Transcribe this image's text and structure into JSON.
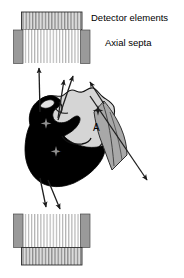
{
  "figure": {
    "type": "diagram",
    "background_color": "#ffffff"
  },
  "annotations": {
    "detector_elements_label": "Detector elements",
    "axial_septa_label": "Axial septa"
  },
  "markers": {
    "a": "A",
    "b": "B",
    "c": "C"
  },
  "colors": {
    "outline": "#000000",
    "septa_block": "#9a9a9a",
    "detector_fill": "#d8d8d8",
    "detector_stripe": "#7a7a7a",
    "organ_dark": "#000000",
    "organ_light": "#d5d5d5",
    "organ_mid": "#a8a8a8",
    "ray": "#262626"
  },
  "detectors": {
    "top": {
      "bar_stripe_count": 26,
      "septa_stripe_count": 22
    },
    "bottom": {
      "bar_stripe_count": 26,
      "septa_stripe_count": 22
    }
  },
  "rays": {
    "up_vertical": "gamma ray to top detector",
    "up_left_diagonal": "gamma ray to top detector",
    "up_right_diagonal": "gamma ray to top detector",
    "oblique_through_septa": "oblique gamma ray crossing septa",
    "down_left_diagonal": "gamma ray to bottom detector",
    "down_right_diagonal": "gamma ray to bottom detector"
  }
}
